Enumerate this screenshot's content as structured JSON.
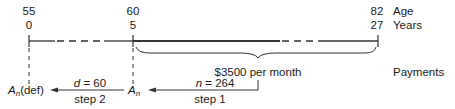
{
  "diagram": {
    "type": "annuity-timeline",
    "row_labels": {
      "age": "Age",
      "years": "Years",
      "payments": "Payments"
    },
    "ticks": [
      {
        "age": "55",
        "years": "0",
        "x": 29
      },
      {
        "age": "60",
        "years": "5",
        "x": 133
      },
      {
        "age": "82",
        "years": "27",
        "x": 378
      }
    ],
    "payment_label": "$3500 per month",
    "step1": {
      "var": "n",
      "eq": " = 264",
      "label": "step 1",
      "target": "A",
      "target_sub": "n"
    },
    "step2": {
      "var": "d",
      "eq": " = 60",
      "label": "step 2",
      "target": "A",
      "target_sub": "n",
      "target_suffix": "(def)"
    },
    "colors": {
      "line": "#333333",
      "text": "#1a1a1a",
      "background": "#ffffff"
    }
  }
}
